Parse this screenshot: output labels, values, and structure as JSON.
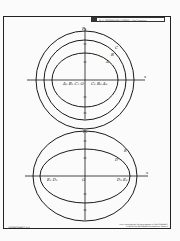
{
  "header": {
    "title": "W. H. FREEMAN AND COMPANY • San Francisco"
  },
  "footer": {
    "transparency_label": "TRANSPARENCY 5-2",
    "credit_line1": "To be used with the Revised Edition of CARTOGRAPHIC",
    "credit_line2": "& PHYSICAL GEOGRAPHY by Arthur N. Strahler"
  },
  "diagram_top": {
    "axis_x_label": "x",
    "axis_y_label": "P₂",
    "curve_labels": [
      "A",
      "B",
      "C"
    ],
    "axis_point_labels": [
      "A₁ B₁ C₁ O",
      "C₂ B₂ A₂"
    ]
  },
  "diagram_bottom": {
    "axis_x_label": "x",
    "axis_y_label": "P₂",
    "curve_labels": [
      "E",
      "D"
    ],
    "origin_label": "O",
    "left_labels": "E₁ D₁",
    "right_labels": "D₂ E₂"
  }
}
